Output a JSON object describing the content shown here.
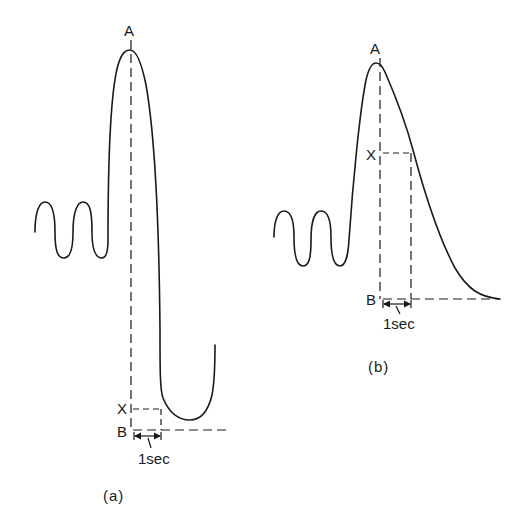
{
  "figure_a": {
    "caption": "(a)",
    "label_peak": "A",
    "label_x": "X",
    "label_b": "B",
    "time_scale": "1sec"
  },
  "figure_b": {
    "caption": "(b)",
    "label_peak": "A",
    "label_x": "X",
    "label_b": "B",
    "time_scale": "1sec"
  },
  "colors": {
    "ink": "#1a1a1a",
    "background": "#ffffff"
  }
}
